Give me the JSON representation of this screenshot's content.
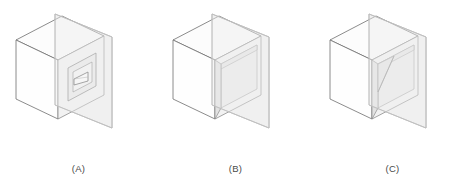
{
  "sheet": {
    "background_color": "#ffffff",
    "figure_count": 3,
    "description": "Three isometric line drawings of a cube intersected by a transparent vertical cutting plane"
  },
  "style": {
    "outline_color": "#6b6b6b",
    "thin_line_color": "#9a9a9a",
    "plane_edge_color": "#b9b9b9",
    "cube_top_fill": "#fbfbfb",
    "cube_left_fill": "#fdfdfd",
    "cube_front_fill": "#f4f4f4",
    "plane_fill": "#f2f2f2",
    "recess_fill": "#ededed",
    "caption_color": "#4a4a4a"
  },
  "figures": [
    {
      "id": "a",
      "caption": "(A)",
      "feature_name": "triangular-recess",
      "feature_description": "small triangular (wedge) recess centered in the front face",
      "cube": {
        "top_face": "70,38 128,14 186,38 128,62",
        "left_face": "70,38 70,105 128,129 128,62",
        "front_face": "128,62 186,38 186,105 128,129"
      },
      "plane": {
        "outline": "152,24 209,47 209,138 152,115",
        "front_quad": "152,24 209,47 209,138 152,115"
      },
      "recess": {
        "outer": "143,74 176,60 176,92 143,106",
        "inner_triangle": "152,85 168,78 168,90 152,92"
      }
    },
    {
      "id": "b",
      "caption": "(B)",
      "feature_name": "square-recess",
      "feature_description": "square recessed cavity occupying the front face with visible inner walls",
      "cube": {
        "top_face": "70,38 128,14 186,38 128,62",
        "left_face": "70,38 70,105 128,129 128,62",
        "front_face": "128,62 186,38 186,105 128,129"
      },
      "plane": {
        "outline": "152,24 209,47 209,138 152,115"
      },
      "recess": {
        "outer": "132,64 184,43 184,101 132,122",
        "inner": "140,73 180,57 180,97 140,113"
      }
    },
    {
      "id": "c",
      "caption": "(C)",
      "feature_name": "diagonal-cut-recess",
      "feature_description": "square recess with a diagonal line running from the upper corner down to the left wall",
      "cube": {
        "top_face": "70,38 128,14 186,38 128,62",
        "left_face": "70,38 70,105 128,129 128,62",
        "front_face": "128,62 186,38 186,105 128,129"
      },
      "plane": {
        "outline": "152,24 209,47 209,138 152,115"
      },
      "recess": {
        "outer": "132,64 184,43 184,101 132,122",
        "inner": "140,73 180,57 180,97 140,113",
        "diagonal": "140,96 167,60"
      }
    }
  ],
  "captions": {
    "a": "(A)",
    "b": "(B)",
    "c": "(C)"
  }
}
